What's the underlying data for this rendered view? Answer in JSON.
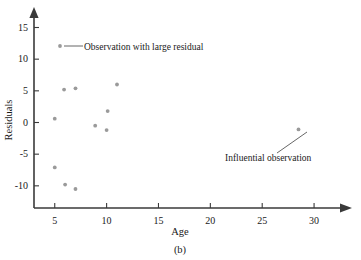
{
  "chart_data": {
    "type": "scatter",
    "title": "",
    "xlabel": "Age",
    "ylabel": "Residuals",
    "caption": "(b)",
    "xlim": [
      3.0,
      32.5
    ],
    "ylim": [
      -13.5,
      16.5
    ],
    "xticks": [
      5,
      10,
      15,
      20,
      25,
      30
    ],
    "yticks": [
      -10,
      -5,
      0,
      5,
      10,
      15
    ],
    "grid": false,
    "legend_position": "none",
    "marker_color": "#9a9a9a",
    "axis_color": "#3a3a3a",
    "points": [
      {
        "age": 5.0,
        "residual": 0.6
      },
      {
        "age": 5.9,
        "residual": 5.2
      },
      {
        "age": 7.0,
        "residual": 5.4
      },
      {
        "age": 5.0,
        "residual": -7.1
      },
      {
        "age": 6.0,
        "residual": -9.8
      },
      {
        "age": 7.0,
        "residual": -10.5
      },
      {
        "age": 8.9,
        "residual": -0.5
      },
      {
        "age": 10.1,
        "residual": 1.8
      },
      {
        "age": 10.0,
        "residual": -1.2
      },
      {
        "age": 11.0,
        "residual": 6.0
      },
      {
        "age": 28.5,
        "residual": -1.1
      }
    ],
    "annotations": [
      {
        "name": "large-residual",
        "text": "Observation with large residual",
        "text_x": 84,
        "text_y": 50,
        "marker_x": 60,
        "marker_y": 46,
        "line_x1": 64,
        "line_y1": 46,
        "line_x2": 83,
        "line_y2": 46
      },
      {
        "name": "influential-observation",
        "text": "Influential observation",
        "text_x": 225,
        "text_y": 163,
        "line_x1": 277,
        "line_y1": 153,
        "line_x2": 307,
        "line_y2": 132
      }
    ]
  },
  "axis_label_positions": {
    "xlabel_x": 180,
    "xlabel_y": 227,
    "ylabel_x": 9,
    "ylabel_y": 120,
    "caption_x": 180,
    "caption_y": 245
  }
}
